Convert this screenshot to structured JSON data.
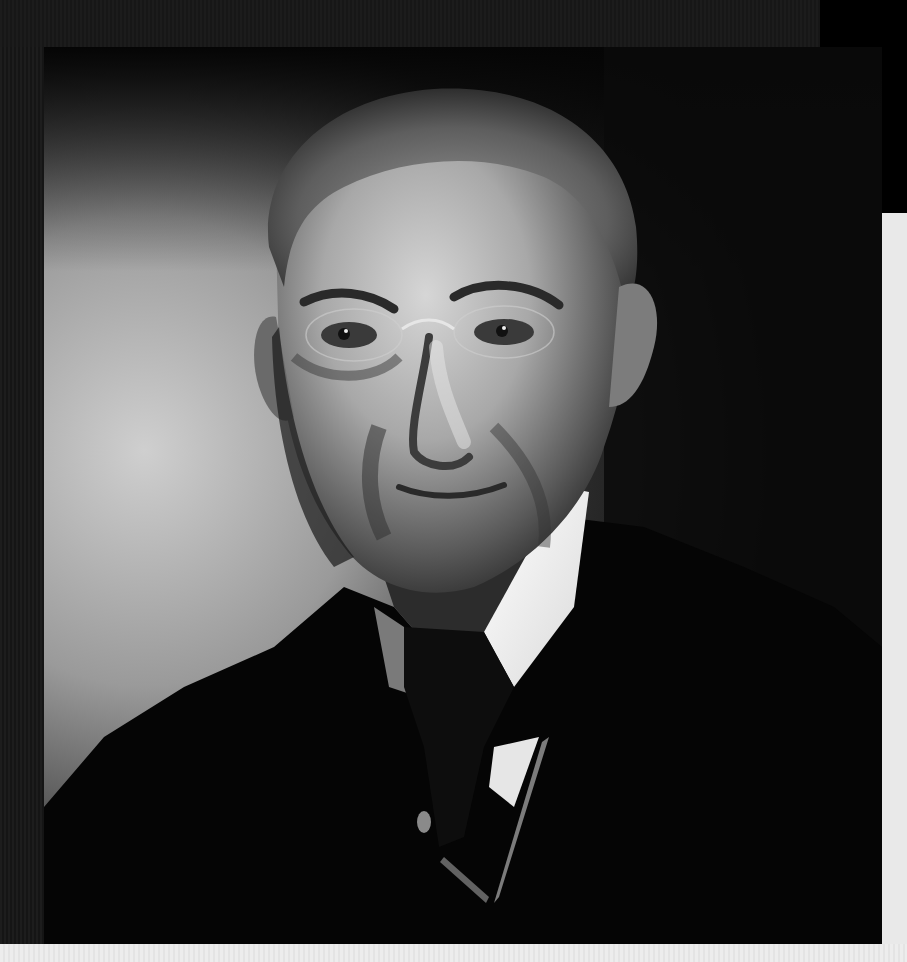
{
  "image": {
    "subject": "black-and-white studio portrait of an older man in dark suit, white collar, dark tie and pince-nez glasses",
    "alt": "Portrait photograph"
  },
  "colors": {
    "frame": "#1a1a1a",
    "corner": "#000000",
    "panel": "#e9e9e9",
    "bottom_strip": "#ececec",
    "background_light": "#c9c9c9",
    "suit": "#050505",
    "collar": "#f2f2f2",
    "skin_light": "#b8b8b8",
    "skin_shadow": "#3a3a3a",
    "hair": "#7a7a7a"
  }
}
